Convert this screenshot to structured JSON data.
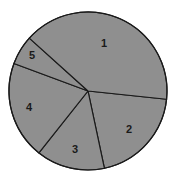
{
  "chart_data": {
    "type": "pie",
    "title": "",
    "categories": [
      "1",
      "2",
      "3",
      "4",
      "5"
    ],
    "values": [
      40,
      20,
      14,
      20,
      6
    ],
    "unit": "percent (estimated from slice angles)",
    "legend": "none (slices labeled directly with numbers)",
    "layout": {
      "center": [
        88,
        91
      ],
      "radius": 79,
      "start_angle_deg_clockwise_from_3_oclock": 6,
      "draw_order": [
        "2",
        "3",
        "4",
        "5",
        "1"
      ],
      "direction": "clockwise"
    },
    "fill_color": "#8f8f8f",
    "edge_color": "#1a1a1a",
    "label_positions": {
      "1": [
        104,
        43
      ],
      "2": [
        129,
        129
      ],
      "3": [
        75,
        149
      ],
      "4": [
        29,
        107
      ],
      "5": [
        32,
        55
      ]
    }
  }
}
